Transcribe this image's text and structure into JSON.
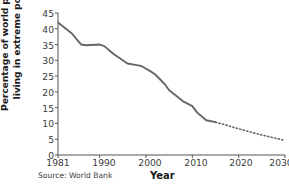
{
  "chart_data": {
    "type": "line",
    "title": "",
    "xlabel": "Year",
    "ylabel_line1": "Percentage of world population",
    "ylabel_line2": "living in extreme poverty",
    "source": "Source: World Bank",
    "xlim": [
      1981,
      2030
    ],
    "ylim": [
      0,
      45
    ],
    "grid": false,
    "legend": "none",
    "line_color": "#666666",
    "axis_color": "#555555",
    "text_color": "#333333",
    "yticks": [
      45,
      40,
      35,
      30,
      25,
      20,
      15,
      10,
      5,
      0
    ],
    "xticks": [
      1981,
      1990,
      2000,
      2010,
      2020,
      2030
    ],
    "series": [
      {
        "name": "Historical",
        "style": "solid",
        "x": [
          1981,
          1984,
          1986,
          1987,
          1990,
          1991,
          1993,
          1996,
          1998,
          1999,
          2001,
          2002,
          2004,
          2005,
          2008,
          2010,
          2011,
          2013,
          2015
        ],
        "values": [
          42,
          38.5,
          35,
          34.8,
          35,
          34.5,
          32,
          29,
          28.5,
          28.2,
          26.5,
          25.5,
          22.5,
          20.5,
          17,
          15.5,
          13.5,
          11,
          10.4
        ]
      },
      {
        "name": "Projection",
        "style": "dotted",
        "x": [
          2015,
          2017,
          2020,
          2023,
          2026,
          2030
        ],
        "values": [
          10.4,
          9.6,
          8.3,
          7.1,
          6,
          4.6
        ]
      }
    ]
  }
}
